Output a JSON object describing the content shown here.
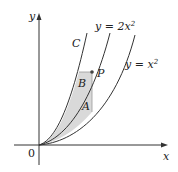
{
  "figure": {
    "axes": {
      "x_label": "x",
      "y_label": "y",
      "origin_label": "0"
    },
    "curves": [
      {
        "id": "C",
        "label": "C"
      },
      {
        "id": "y2x2",
        "label_prefix": "y = 2x",
        "label_exp": "2"
      },
      {
        "id": "yx2",
        "label_prefix": "y = x",
        "label_exp": "2"
      }
    ],
    "point": {
      "label": "P"
    },
    "regions": [
      {
        "label": "A"
      },
      {
        "label": "B"
      }
    ],
    "colors": {
      "stroke": "#333333",
      "shade": "#d9d9d9",
      "point": "#444444"
    }
  }
}
